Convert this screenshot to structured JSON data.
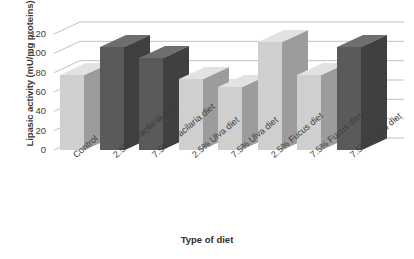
{
  "chart_data": {
    "type": "bar",
    "title": "",
    "xlabel": "Type of diet",
    "ylabel": "Lipasic activity (mU/mg proteins)",
    "categories": [
      "Control",
      "2.5% Gracilaria diet",
      "7.5% Gracilaria diet",
      "2.5% Ulva diet",
      "7.5% Ulva diet",
      "2.5% Fucus diet",
      "7.5% Fucus diet",
      "7.5% Mixed diet"
    ],
    "values": [
      78,
      107,
      95,
      73,
      65,
      112,
      78,
      107
    ],
    "bar_shades": [
      "light",
      "dark",
      "dark",
      "light",
      "light",
      "light",
      "light",
      "dark"
    ],
    "ylim": [
      0,
      120
    ],
    "yticks": [
      0,
      20,
      40,
      60,
      80,
      100,
      120
    ],
    "ytick_labels": [
      "0",
      "20",
      "40",
      "60",
      "80",
      "100",
      "120"
    ],
    "grid": true,
    "grid_axis": "y",
    "legend": false,
    "legend_position": "none",
    "style": "3d-column",
    "colors": {
      "bar_light_front": "#cfcfcf",
      "bar_light_side": "#9c9c9c",
      "bar_light_top": "#e2e2e2",
      "bar_dark_front": "#5a5a5a",
      "bar_dark_side": "#404040",
      "bar_dark_top": "#6e6e6e",
      "gridline": "#b9b9b9",
      "text": "#3c3c3c",
      "background": "#ffffff"
    }
  }
}
